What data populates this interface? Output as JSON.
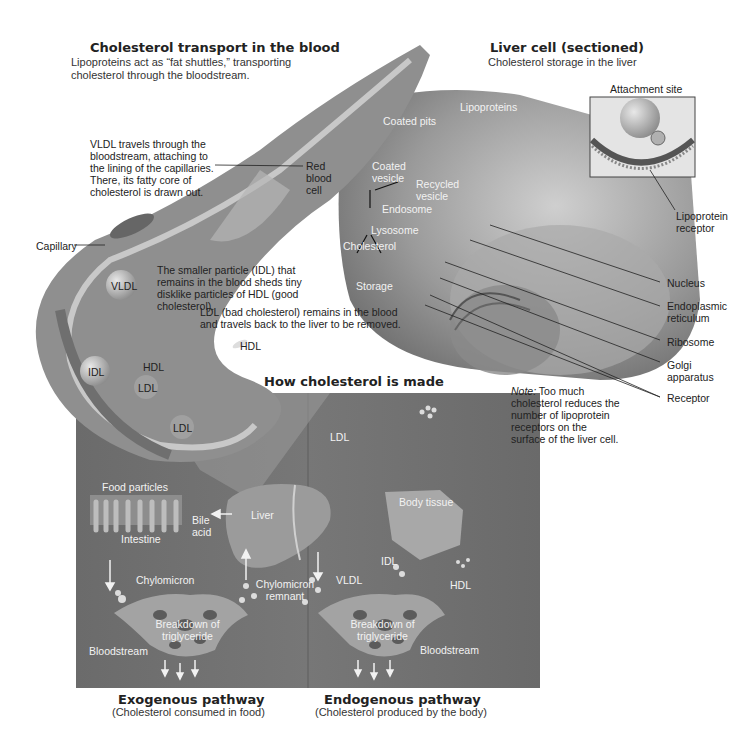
{
  "transport": {
    "title": "Cholesterol transport in the blood",
    "subtitle": "Lipoproteins act as “fat shuttles,” transporting cholesterol through the bloodstream.",
    "vldl_text": "VLDL travels through the bloodstream, attaching to the lining of the capillaries. There, its fatty core of cholesterol is drawn out.",
    "red_blood_cell": "Red blood cell",
    "capillary": "Capillary",
    "idl_text": "The smaller particle (IDL) that remains in the blood sheds tiny disklike particles of HDL (good cholesterol).",
    "ldl_text": "LDL (bad cholesterol) remains in the blood and travels back to the liver to be removed.",
    "particles": {
      "vldl": "VLDL",
      "idl": "IDL",
      "hdl1": "HDL",
      "ldl1": "LDL",
      "ldl2": "LDL",
      "hdl2": "HDL"
    }
  },
  "liver_cell": {
    "title": "Liver cell (sectioned)",
    "subtitle": "Cholesterol storage in the liver",
    "attachment_site": "Attachment site",
    "lipoproteins": "Lipoproteins",
    "coated_pits": "Coated pits",
    "coated_vesicle": "Coated vesicle",
    "recycled_vesicle": "Recycled vesicle",
    "endosome": "Endosome",
    "lysosome": "Lysosome",
    "cholesterol": "Cholesterol",
    "storage": "Storage",
    "lipoprotein_receptor": "Lipoprotein receptor",
    "nucleus": "Nucleus",
    "endoplasmic_reticulum": "Endoplasmic reticulum",
    "ribosome": "Ribosome",
    "golgi": "Golgi apparatus",
    "receptor": "Receptor",
    "note_label": "Note:",
    "note_text": " Too much cholesterol reduces the number of lipoprotein receptors on the surface of the liver cell."
  },
  "made": {
    "title": "How cholesterol is made",
    "ldl": "LDL",
    "food_particles": "Food particles",
    "intestine": "Intestine",
    "bile_acid": "Bile acid",
    "liver": "Liver",
    "body_tissue": "Body tissue",
    "chylomicron": "Chylomicron",
    "chylomicron_remnant": "Chylomicron remnant",
    "vldl": "VLDL",
    "idl": "IDL",
    "hdl": "HDL",
    "breakdown1": "Breakdown of triglyceride",
    "breakdown2": "Breakdown of triglyceride",
    "bloodstream1": "Bloodstream",
    "bloodstream2": "Bloodstream",
    "exogenous_title": "Exogenous pathway",
    "exogenous_sub": "(Cholesterol consumed in food)",
    "endogenous_title": "Endogenous pathway",
    "endogenous_sub": "(Cholesterol produced by the body)"
  }
}
